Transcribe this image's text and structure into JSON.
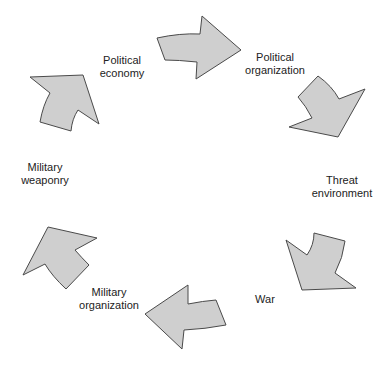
{
  "diagram": {
    "type": "cycle",
    "arrow_fill": "#cfcfcf",
    "arrow_stroke": "#4a4a4a",
    "nodes": [
      {
        "id": "political-economy",
        "lines": [
          "Political",
          "economy"
        ]
      },
      {
        "id": "political-organization",
        "lines": [
          "Political",
          "organization"
        ]
      },
      {
        "id": "threat-environment",
        "lines": [
          "Threat",
          "environment"
        ]
      },
      {
        "id": "war",
        "lines": [
          "War"
        ]
      },
      {
        "id": "military-organization",
        "lines": [
          "Military",
          "organization"
        ]
      },
      {
        "id": "military-weaponry",
        "lines": [
          "Military",
          "weaponry"
        ]
      }
    ],
    "edges": [
      {
        "from": "political-economy",
        "to": "political-organization"
      },
      {
        "from": "political-organization",
        "to": "threat-environment"
      },
      {
        "from": "threat-environment",
        "to": "war"
      },
      {
        "from": "war",
        "to": "military-organization"
      },
      {
        "from": "military-organization",
        "to": "military-weaponry"
      },
      {
        "from": "military-weaponry",
        "to": "political-economy"
      }
    ]
  }
}
